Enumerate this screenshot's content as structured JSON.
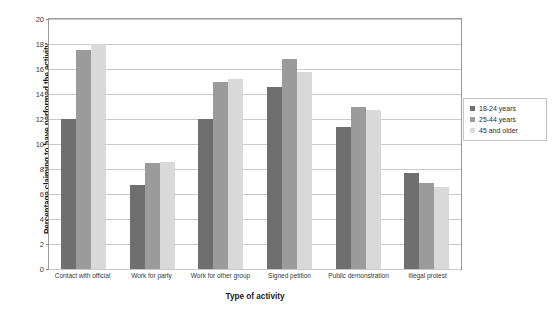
{
  "chart_data": {
    "type": "bar",
    "title": "",
    "xlabel": "Type of activity",
    "ylabel": "Percentage claiming to have performed the activity",
    "ylim": [
      0,
      20
    ],
    "ytick_step": 2,
    "yticks": [
      0,
      2,
      4,
      6,
      8,
      10,
      12,
      14,
      16,
      18,
      20
    ],
    "grid": true,
    "legend_position": "right",
    "categories": [
      "Contact with official",
      "Work for party",
      "Work for other group",
      "Signed petition",
      "Public demonstration",
      "Illegal protest"
    ],
    "series": [
      {
        "name": "18-24 years",
        "color": "#6f6f6f",
        "values": [
          12.0,
          6.7,
          12.0,
          14.6,
          11.4,
          7.7
        ]
      },
      {
        "name": "25-44 years",
        "color": "#9b9b9b",
        "values": [
          17.5,
          8.5,
          15.0,
          16.8,
          13.0,
          6.9
        ]
      },
      {
        "name": "45 and older",
        "color": "#d9d9d9",
        "values": [
          18.0,
          8.6,
          15.2,
          15.8,
          12.7,
          6.6
        ]
      }
    ]
  },
  "axes": {
    "y_title": "Percentage claiming to have performed the activity",
    "x_title": "Type of activity"
  },
  "legend": {
    "items": [
      {
        "label": "18-24 years",
        "color": "#6f6f6f"
      },
      {
        "label": "25-44 years",
        "color": "#9b9b9b"
      },
      {
        "label": "45 and older",
        "color": "#d9d9d9"
      }
    ]
  },
  "colors": {
    "series_18_24": "#6f6f6f",
    "series_25_44": "#9b9b9b",
    "series_45_plus": "#d9d9d9",
    "gridline": "#c9c9c9",
    "axis": "#8e8e8e",
    "background": "#ffffff"
  }
}
